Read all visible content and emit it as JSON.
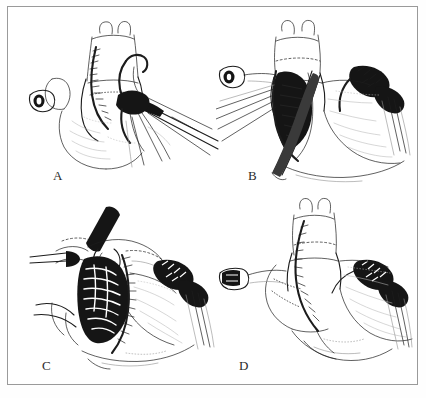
{
  "figure": {
    "kind": "surgical-illustration-plate",
    "background_color": "#ffffff",
    "frame_color": "#9a9a9a",
    "ink_color": "#1c1c1c",
    "panel_count": 4,
    "panels": [
      {
        "id": "a",
        "label": "A",
        "subject": "heart with aorta and pulmonary artery, surgical forceps grasping vessel",
        "elements": [
          "ascending-aorta",
          "pulmonary-artery",
          "atrial-appendage",
          "cannula-tube",
          "suture-line",
          "forceps-instrument",
          "suture-threads"
        ]
      },
      {
        "id": "b",
        "label": "B",
        "subject": "open vessel incision held by retractor with suture threads on left and sutured patch on right",
        "elements": [
          "ascending-aorta",
          "open-incision",
          "retractor-instrument",
          "suture-threads",
          "sutured-patch",
          "cannula-tube",
          "ventricle-surface"
        ]
      },
      {
        "id": "c",
        "label": "C",
        "subject": "open cardiac cavity exposed with running suture row, clamp at top and sutured graft at right",
        "elements": [
          "open-cavity",
          "running-suture-row",
          "clamp-instrument",
          "sutured-graft",
          "suture-threads",
          "vessel-stumps"
        ]
      },
      {
        "id": "d",
        "label": "D",
        "subject": "completed repair showing closed suture lines on aorta and pulmonary artery",
        "elements": [
          "ascending-aorta",
          "pulmonary-artery",
          "completed-suture-line",
          "sutured-graft",
          "cannula-tube",
          "ventricle-surface"
        ]
      }
    ]
  }
}
